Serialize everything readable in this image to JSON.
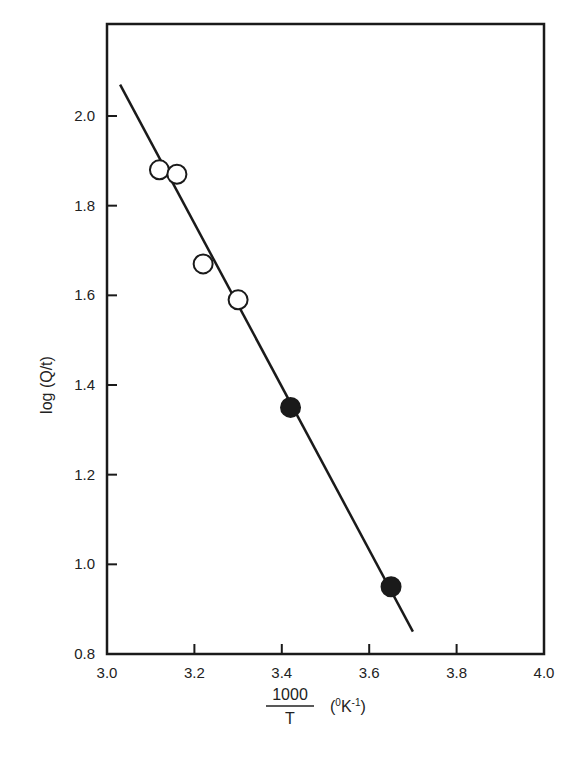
{
  "chart_data": {
    "type": "scatter",
    "title": "",
    "xlabel": "1000/T (°K-1)",
    "ylabel": "log (Q/t)",
    "xlim": [
      3.0,
      4.0
    ],
    "ylim": [
      0.8,
      2.15
    ],
    "x_ticks": [
      "3.0",
      "3.2",
      "3.4",
      "3.6",
      "3.8",
      "4.0"
    ],
    "y_ticks": [
      "0.8",
      "1.0",
      "1.2",
      "1.4",
      "1.6",
      "1.8",
      "2.0"
    ],
    "grid": false,
    "legend": null,
    "series": [
      {
        "name": "open circles",
        "marker": "open-circle",
        "x": [
          3.12,
          3.16,
          3.22,
          3.3
        ],
        "y": [
          1.88,
          1.87,
          1.67,
          1.59
        ]
      },
      {
        "name": "filled circles",
        "marker": "filled-circle",
        "x": [
          3.42,
          3.65
        ],
        "y": [
          1.35,
          0.95
        ]
      },
      {
        "name": "fit line",
        "type": "line",
        "x": [
          3.03,
          3.7
        ],
        "y": [
          2.07,
          0.85
        ]
      }
    ]
  },
  "labels": {
    "ylabel": "log (Q/t)",
    "xlabel_num": "1000",
    "xlabel_den": "T",
    "xlabel_unit_open": "(",
    "xlabel_unit_sup": "0",
    "xlabel_unit_K": "K",
    "xlabel_unit_exp": "-1",
    "xlabel_unit_close": ")"
  },
  "colors": {
    "ink": "#1a1a1a",
    "background": "#ffffff"
  }
}
